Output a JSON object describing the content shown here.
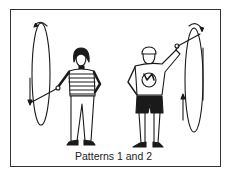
{
  "caption": "Patterns 1 and 2",
  "figures": [
    {
      "name": "left-figure",
      "description": "girl in striped shirt swinging rope loop down on her right side",
      "pattern": 1
    },
    {
      "name": "right-figure",
      "description": "boy in t-shirt and shorts swinging rope loop up on his left side",
      "pattern": 2
    }
  ],
  "colors": {
    "line": "#1a1a1a",
    "background": "#ffffff",
    "frame": "#333333"
  }
}
